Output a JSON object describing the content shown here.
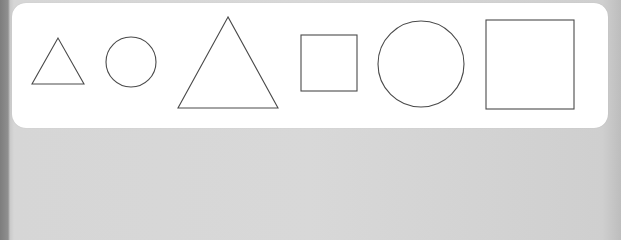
{
  "figure": {
    "colors": {
      "panel_background": "#ffffff",
      "frame": "#d6d6d6",
      "frame_dark_edge": "#7d7d7d",
      "stroke": "#4a4a4a"
    },
    "shapes": [
      {
        "id": "triangle-small",
        "type": "triangle",
        "size": "small",
        "points": "58,38 32,84 84,84"
      },
      {
        "id": "circle-small",
        "type": "circle",
        "size": "small",
        "cx": 131,
        "cy": 62,
        "r": 25
      },
      {
        "id": "triangle-large",
        "type": "triangle",
        "size": "large",
        "points": "228,17 178,108 278,108"
      },
      {
        "id": "square-small",
        "type": "square",
        "size": "small",
        "x": 301,
        "y": 35,
        "width": 56,
        "height": 56
      },
      {
        "id": "circle-large",
        "type": "circle",
        "size": "large",
        "cx": 421,
        "cy": 64,
        "r": 43
      },
      {
        "id": "square-large",
        "type": "square",
        "size": "large",
        "x": 486,
        "y": 20,
        "width": 88,
        "height": 89
      }
    ]
  }
}
